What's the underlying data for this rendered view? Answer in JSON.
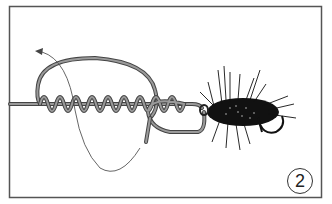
{
  "illustration": {
    "subject": "fishing knot tying step with fly hook",
    "step_number": "2",
    "colors": {
      "frame": "#555555",
      "line": "#777777",
      "line_outline": "#444444",
      "arrow": "#555555",
      "fly_body": "#111111"
    }
  }
}
